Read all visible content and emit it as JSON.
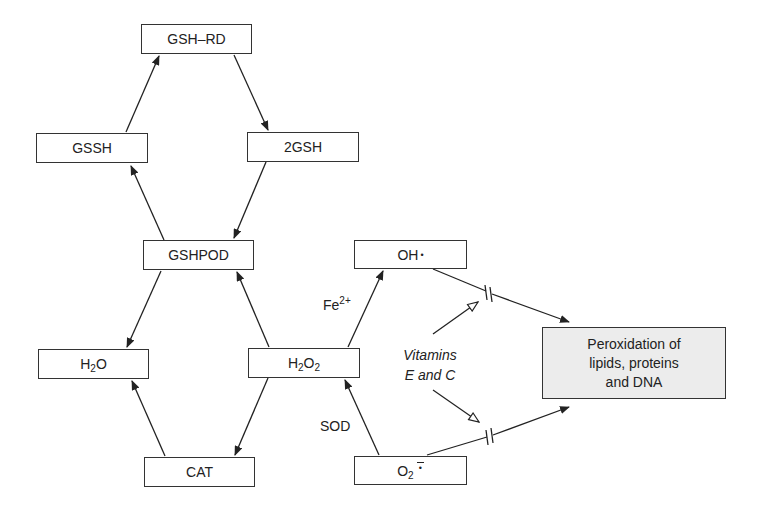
{
  "diagram": {
    "type": "reaction-pathway",
    "nodes": {
      "gsh_rd": {
        "label": "GSH–RD"
      },
      "gssh": {
        "label": "GSSH"
      },
      "two_gsh": {
        "label": "2GSH"
      },
      "gshpod": {
        "label": "GSHPOD"
      },
      "h2o": {
        "base": "H",
        "sub": "2",
        "rest": "O"
      },
      "h2o2": {
        "base": "H",
        "sub1": "2",
        "mid": "O",
        "sub2": "2"
      },
      "cat": {
        "label": "CAT"
      },
      "oh": {
        "label": "OH",
        "radical": "•"
      },
      "o2": {
        "base": "O",
        "sub": "2",
        "radical": "•"
      },
      "peroxidation": {
        "line1": "Peroxidation of",
        "line2": "lipids, proteins",
        "line3": "and DNA"
      }
    },
    "edge_labels": {
      "fe": {
        "base": "Fe",
        "sup": "2+"
      },
      "sod": "SOD",
      "vitamins_line1": "Vitamins",
      "vitamins_line2": "E and C"
    },
    "edges": [
      {
        "from": "GSSH",
        "to": "GSH–RD"
      },
      {
        "from": "GSH–RD",
        "to": "2GSH"
      },
      {
        "from": "2GSH",
        "to": "GSHPOD"
      },
      {
        "from": "GSHPOD",
        "to": "GSSH"
      },
      {
        "from": "GSHPOD",
        "to": "H2O"
      },
      {
        "from": "H2O2",
        "to": "GSHPOD"
      },
      {
        "from": "H2O2",
        "to": "CAT"
      },
      {
        "from": "CAT",
        "to": "H2O"
      },
      {
        "from": "H2O2",
        "to": "OH•",
        "label": "Fe2+"
      },
      {
        "from": "O2•−",
        "to": "H2O2",
        "label": "SOD"
      },
      {
        "from": "OH•",
        "to": "Peroxidation",
        "inhibited_by": "Vitamins E and C"
      },
      {
        "from": "O2•−",
        "to": "Peroxidation",
        "inhibited_by": "Vitamins E and C"
      }
    ],
    "colors": {
      "line": "#222222",
      "box_border": "#333333",
      "shaded_box": "#ececec"
    }
  }
}
